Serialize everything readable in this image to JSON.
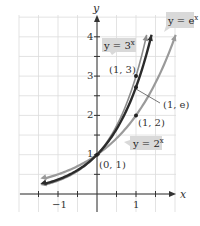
{
  "chart_data": {
    "type": "line",
    "title": "",
    "xlabel": "x",
    "ylabel": "y",
    "xlim": [
      -1.35,
      1.35
    ],
    "ylim": [
      -0.4,
      4.5
    ],
    "grid": true,
    "grid_step": 0.5,
    "x_ticks": [
      {
        "value": -1,
        "label": "−1"
      },
      {
        "value": 1,
        "label": "1"
      }
    ],
    "y_ticks": [
      {
        "value": 1,
        "label": "1"
      },
      {
        "value": 2,
        "label": "2"
      },
      {
        "value": 3,
        "label": "3"
      },
      {
        "value": 4,
        "label": "4"
      }
    ],
    "series": [
      {
        "name": "y = 2^x",
        "label": "y = 2",
        "exp": "x",
        "base": 2,
        "color": "#9a9a9a",
        "width": 2.2
      },
      {
        "name": "y = e^x",
        "label": "y = e",
        "exp": "x",
        "base": 2.718281828,
        "color": "#2b2b2b",
        "width": 2.4
      },
      {
        "name": "y = 3^x",
        "label": "y = 3",
        "exp": "x",
        "base": 3,
        "color": "#8c8c8c",
        "width": 1.6
      }
    ],
    "points": [
      {
        "x": 0,
        "y": 1,
        "label": "(0, 1)"
      },
      {
        "x": 1,
        "y": 2,
        "label": "(1, 2)"
      },
      {
        "x": 1,
        "y": 2.718,
        "label": "(1, e)"
      },
      {
        "x": 1,
        "y": 3,
        "label": "(1, 3)"
      }
    ],
    "annotations": [
      {
        "text": "y = 3^x",
        "target_series": "y = 3^x"
      },
      {
        "text": "y = e^x",
        "target_series": "y = e^x"
      },
      {
        "text": "y = 2^x",
        "target_series": "y = 2^x"
      }
    ]
  },
  "labels": {
    "x_axis": "x",
    "y_axis": "y",
    "tick_x_neg1": "−1",
    "tick_x_1": "1",
    "tick_y_1": "1",
    "tick_y_2": "2",
    "tick_y_3": "3",
    "tick_y_4": "4",
    "pt_0_1": "(0, 1)",
    "pt_1_2": "(1, 2)",
    "pt_1_e": "(1, e)",
    "pt_1_3": "(1, 3)",
    "callout_3x_base": "y = 3",
    "callout_3x_exp": "x",
    "callout_ex_base": "y = e",
    "callout_ex_exp": "x",
    "callout_2x_base": "y = 2",
    "callout_2x_exp": "x"
  },
  "colors": {
    "grid": "#dcdcdc",
    "axis": "#333333",
    "callout_bg": "#d9d9d9"
  }
}
